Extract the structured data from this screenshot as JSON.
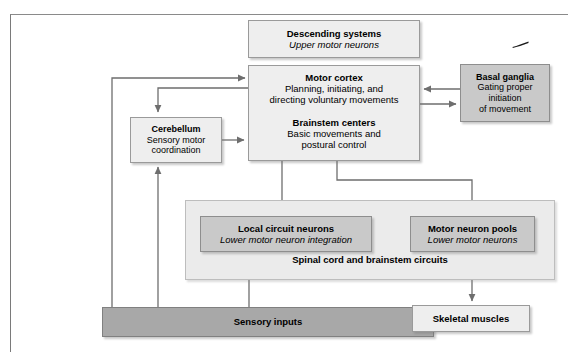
{
  "diagram": {
    "colors": {
      "light_box": "#eeeeee",
      "mid_box": "#c9c9c9",
      "dark_bar": "#a8a8a8",
      "container": "#ebebeb",
      "arrow": "#6e6e6e",
      "border": "#9a9a9a",
      "background": "#ffffff"
    },
    "nodes": {
      "descending": {
        "title": "Descending systems",
        "subtitle": "Upper motor neurons"
      },
      "motor_cortex": {
        "title": "Motor cortex",
        "line1": "Planning, initiating, and",
        "line2": "directing voluntary movements"
      },
      "brainstem": {
        "title": "Brainstem centers",
        "line1": "Basic movements and",
        "line2": "postural control"
      },
      "basal_ganglia": {
        "title": "Basal ganglia",
        "line1": "Gating proper",
        "line2": "initiation",
        "line3": "of movement"
      },
      "cerebellum": {
        "title": "Cerebellum",
        "line1": "Sensory motor",
        "line2": "coordination"
      },
      "spinal_container": {
        "caption": "Spinal cord and brainstem circuits"
      },
      "local_circuit": {
        "title": "Local circuit neurons",
        "subtitle": "Lower motor neuron integration"
      },
      "motor_neuron_pools": {
        "title": "Motor neuron pools",
        "subtitle": "Lower motor neurons"
      },
      "sensory_inputs": {
        "title": "Sensory inputs"
      },
      "skeletal_muscles": {
        "title": "Skeletal muscles"
      }
    },
    "connections": [
      {
        "from": "sensory_inputs",
        "to": "motor_cortex",
        "style": "plain-arrow",
        "path": "left riser"
      },
      {
        "from": "sensory_inputs",
        "to": "cerebellum",
        "style": "plain-arrow",
        "path": "left riser 2"
      },
      {
        "from": "motor_cortex",
        "to": "cerebellum",
        "style": "plain-arrow",
        "path": "left elbow down"
      },
      {
        "from": "cerebellum",
        "to": "brainstem",
        "style": "plain-arrow",
        "path": "right"
      },
      {
        "from": "basal_ganglia",
        "to": "motor_cortex",
        "style": "plain-arrow",
        "path": "left"
      },
      {
        "from": "motor_cortex",
        "to": "basal_ganglia",
        "style": "plain-arrow",
        "path": "right"
      },
      {
        "from": "brainstem",
        "to": "local_circuit",
        "style": "plain-arrow",
        "path": "down"
      },
      {
        "from": "brainstem",
        "to": "motor_neuron_pools",
        "style": "plain-arrow",
        "path": "elbow right down"
      },
      {
        "from": "local_circuit",
        "to": "motor_neuron_pools",
        "style": "plain-arrow",
        "path": "right"
      },
      {
        "from": "sensory_inputs",
        "to": "local_circuit",
        "style": "plain-arrow",
        "path": "up"
      },
      {
        "from": "motor_neuron_pools",
        "to": "skeletal_muscles",
        "style": "plain-arrow",
        "path": "down"
      }
    ]
  }
}
